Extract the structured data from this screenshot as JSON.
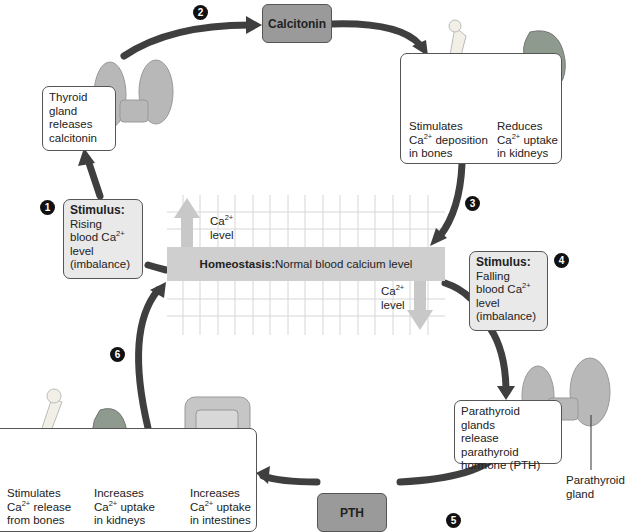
{
  "steps": [
    "1",
    "2",
    "3",
    "4",
    "5",
    "6"
  ],
  "hormones": {
    "calcitonin": "Calcitonin",
    "pth": "PTH"
  },
  "thyroid_box": {
    "text": [
      "Thyroid",
      "gland",
      "releases",
      "calcitonin"
    ]
  },
  "calcitonin_effects": {
    "bones": {
      "l1": "Stimulates",
      "l2a": "Ca",
      "l2sup": "2+",
      "l2b": " deposition",
      "l3": "in bones"
    },
    "kidneys": {
      "l1": "Reduces",
      "l2a": "Ca",
      "l2sup": "2+",
      "l2b": " uptake",
      "l3": "in kidneys"
    }
  },
  "stimulus_rising": {
    "title": "Stimulus:",
    "l1": "Rising",
    "l2a": "blood Ca",
    "l2sup": "2+",
    "l3": "level",
    "l4": "(imbalance)"
  },
  "stimulus_falling": {
    "title": "Stimulus:",
    "l1": "Falling",
    "l2a": "blood Ca",
    "l2sup": "2+",
    "l3": "level",
    "l4": "(imbalance)"
  },
  "homeostasis": {
    "label": "Homeostasis:",
    "text": " Normal blood calcium level"
  },
  "ca_up": {
    "a": "Ca",
    "sup": "2+",
    "b": "level"
  },
  "ca_down": {
    "a": "Ca",
    "sup": "2+",
    "b": "level"
  },
  "parathyroid_box": {
    "text": [
      "Parathyroid",
      "glands",
      "release parathyroid",
      "hormone (PTH)"
    ]
  },
  "parathyroid_label": {
    "l1": "Parathyroid",
    "l2": "gland"
  },
  "pth_effects": {
    "bones": {
      "l1": "Stimulates",
      "l2a": "Ca",
      "l2sup": "2+",
      "l2b": " release",
      "l3": "from bones"
    },
    "kidneys": {
      "l1": "Increases",
      "l2a": "Ca",
      "l2sup": "2+",
      "l2b": " uptake",
      "l3": "in kidneys"
    },
    "intestines": {
      "l1": "Increases",
      "l2a": "Ca",
      "l2sup": "2+",
      "l2b": " uptake",
      "l3": "in intestines"
    }
  },
  "colors": {
    "arrow": "#3f3f3f",
    "hormone_box": "#9a9a9a",
    "stimulus_box": "#e9e9e9",
    "homeostasis_bar": "#cfcfcf",
    "grid": "#d4d4d4",
    "light_arrow": "#c8c8c8"
  }
}
